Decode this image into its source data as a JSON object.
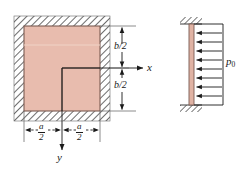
{
  "figure": {
    "colors": {
      "plate_fill": "#e8bcae",
      "plate_edge": "#7a5b52",
      "hatch_line": "#3c3c3c",
      "line": "#1a1a1a",
      "bar_fill": "#e0b3a4"
    },
    "plan_view": {
      "name": "plate-plan-view",
      "axis_x_label": "x",
      "axis_y_label": "y",
      "dimension_top": {
        "numerator": "b",
        "denominator": "2",
        "text": "b/2"
      },
      "dimension_bottom": {
        "numerator": "b",
        "denominator": "2",
        "text": "b/2"
      },
      "dimension_left": {
        "numerator": "a",
        "denominator": "2",
        "text": "a/2"
      },
      "dimension_right": {
        "numerator": "a",
        "denominator": "2",
        "text": "a/2"
      }
    },
    "edge_view": {
      "name": "pressure-edge-view",
      "pressure_label": "p",
      "pressure_subscript": "0",
      "pressure_text": "p0",
      "arrow_count": 8,
      "arrow_direction": "left"
    }
  }
}
